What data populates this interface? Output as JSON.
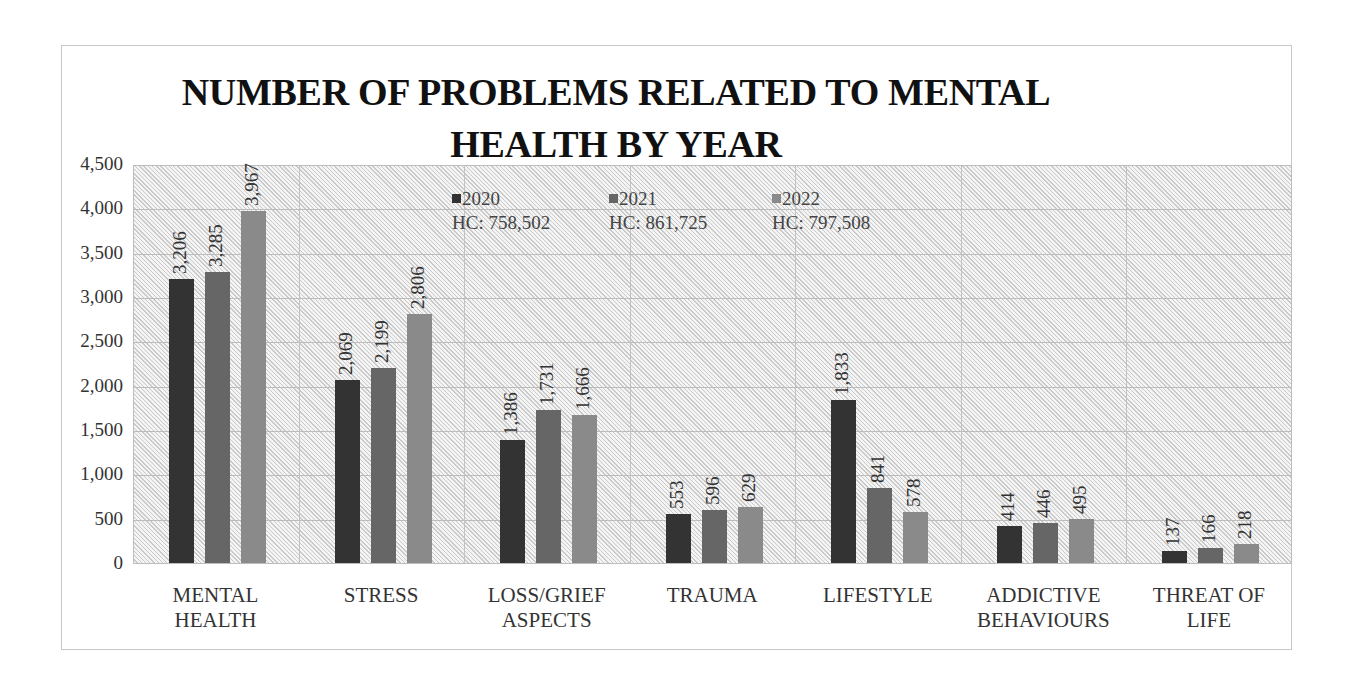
{
  "chart_data": {
    "type": "bar",
    "title": "NUMBER OF PROBLEMS RELATED TO MENTAL HEALTH BY YEAR",
    "title_lines": [
      "NUMBER OF PROBLEMS RELATED TO MENTAL",
      "HEALTH BY YEAR"
    ],
    "xlabel": "",
    "ylabel": "",
    "ylim": [
      0,
      4500
    ],
    "yticks": [
      "0",
      "500",
      "1,000",
      "1,500",
      "2,000",
      "2,500",
      "3,000",
      "3,500",
      "4,000",
      "4,500"
    ],
    "ytick_values": [
      0,
      500,
      1000,
      1500,
      2000,
      2500,
      3000,
      3500,
      4000,
      4500
    ],
    "grid": true,
    "legend_position": "top-inside",
    "categories": [
      "MENTAL HEALTH",
      "STRESS",
      "LOSS/GRIEF ASPECTS",
      "TRAUMA",
      "LIFESTYLE",
      "ADDICTIVE BEHAVIOURS",
      "THREAT OF LIFE"
    ],
    "category_lines": [
      [
        "MENTAL",
        "HEALTH"
      ],
      [
        "STRESS"
      ],
      [
        "LOSS/GRIEF",
        "ASPECTS"
      ],
      [
        "TRAUMA"
      ],
      [
        "LIFESTYLE"
      ],
      [
        "ADDICTIVE",
        "BEHAVIOURS"
      ],
      [
        "THREAT OF",
        "LIFE"
      ]
    ],
    "series": [
      {
        "name": "2020",
        "hc": "HC: 758,502",
        "color": "#333333",
        "values": [
          3206,
          2069,
          1386,
          553,
          1833,
          414,
          137
        ],
        "labels": [
          "3,206",
          "2,069",
          "1,386",
          "553",
          "1,833",
          "414",
          "137"
        ]
      },
      {
        "name": "2021",
        "hc": "HC: 861,725",
        "color": "#666666",
        "values": [
          3285,
          2199,
          1731,
          596,
          841,
          446,
          166
        ],
        "labels": [
          "3,285",
          "2,199",
          "1,731",
          "596",
          "841",
          "446",
          "166"
        ]
      },
      {
        "name": "2022",
        "hc": "HC: 797,508",
        "color": "#8a8a8a",
        "values": [
          3967,
          2806,
          1666,
          629,
          578,
          495,
          218
        ],
        "labels": [
          "3,967",
          "2,806",
          "1,666",
          "629",
          "578",
          "495",
          "218"
        ]
      }
    ]
  }
}
